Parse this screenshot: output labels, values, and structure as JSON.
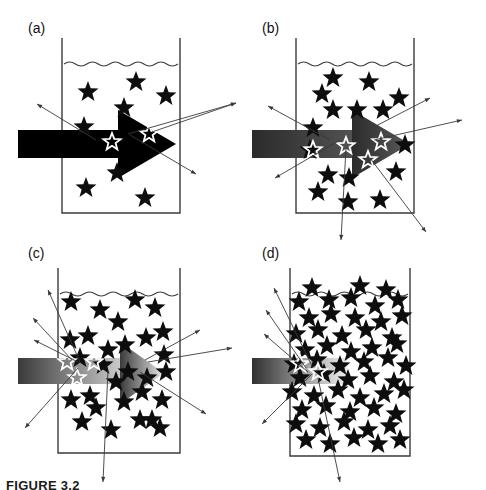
{
  "figure": {
    "caption": "FIGURE 3.2",
    "panels": [
      {
        "id": "a",
        "label": "(a)",
        "label_x": 28,
        "label_y": 33,
        "beaker": {
          "x": 62,
          "y": 38,
          "w": 118,
          "h": 175,
          "rim_extra": 0
        },
        "beam": {
          "style": "solid-arrow",
          "start_color": "#000000",
          "end_color": "#000000",
          "shaft_x": 18,
          "shaft_y": 130,
          "shaft_w": 122,
          "shaft_h": 28,
          "head_x": 118,
          "head_y": 110,
          "head_w": 58,
          "head_h": 68
        },
        "stars_solid": [
          [
            88,
            92
          ],
          [
            136,
            82
          ],
          [
            166,
            96
          ],
          [
            124,
            108
          ],
          [
            117,
            173
          ],
          [
            86,
            188
          ],
          [
            145,
            198
          ],
          [
            84,
            127
          ]
        ],
        "stars_open": [
          [
            112,
            142
          ],
          [
            149,
            134
          ]
        ],
        "star_size": 11,
        "rays": [
          [
            37,
            104,
            96,
            140
          ],
          [
            236,
            103,
            128,
            134
          ],
          [
            196,
            174,
            130,
            135
          ],
          [
            236,
            103,
            152,
            132
          ]
        ]
      },
      {
        "id": "b",
        "label": "(b)",
        "label_x": 262,
        "label_y": 33,
        "beaker": {
          "x": 296,
          "y": 38,
          "w": 118,
          "h": 175,
          "rim_extra": 0
        },
        "beam": {
          "style": "gradient-arrow",
          "start_color": "#2b2b2b",
          "end_color": "#5a5a5a",
          "shaft_x": 252,
          "shaft_y": 130,
          "shaft_w": 122,
          "shaft_h": 28,
          "head_x": 352,
          "head_y": 110,
          "head_w": 58,
          "head_h": 68
        },
        "stars_solid": [
          [
            333,
            78
          ],
          [
            369,
            82
          ],
          [
            322,
            94
          ],
          [
            399,
            98
          ],
          [
            357,
            110
          ],
          [
            333,
            110
          ],
          [
            383,
            110
          ],
          [
            313,
            128
          ],
          [
            328,
            175
          ],
          [
            349,
            178
          ],
          [
            396,
            172
          ],
          [
            318,
            192
          ],
          [
            348,
            202
          ],
          [
            380,
            200
          ],
          [
            405,
            145
          ],
          [
            310,
            150
          ]
        ],
        "stars_open": [
          [
            313,
            150
          ],
          [
            346,
            146
          ],
          [
            381,
            142
          ],
          [
            368,
            160
          ]
        ],
        "star_size": 11,
        "rays": [
          [
            268,
            106,
            330,
            140
          ],
          [
            275,
            178,
            340,
            140
          ],
          [
            430,
            98,
            372,
            128
          ],
          [
            462,
            120,
            374,
            140
          ],
          [
            341,
            240,
            346,
            148
          ],
          [
            426,
            232,
            370,
            158
          ]
        ]
      },
      {
        "id": "c",
        "label": "(c)",
        "label_x": 28,
        "label_y": 258,
        "beaker": {
          "x": 58,
          "y": 268,
          "w": 122,
          "h": 185,
          "rim_extra": 0
        },
        "beam": {
          "style": "gradient-arrow-fading",
          "start_color": "#3a3a3a",
          "end_color": "#e8e8e8",
          "shaft_x": 18,
          "shaft_y": 358,
          "shaft_w": 124,
          "shaft_h": 26,
          "head_x": 120,
          "head_y": 342,
          "head_w": 44,
          "head_h": 62
        },
        "stars_solid": [
          [
            71,
            302
          ],
          [
            100,
            310
          ],
          [
            88,
            336
          ],
          [
            135,
            300
          ],
          [
            70,
            340
          ],
          [
            118,
            322
          ],
          [
            155,
            308
          ],
          [
            125,
            345
          ],
          [
            146,
            338
          ],
          [
            108,
            350
          ],
          [
            164,
            355
          ],
          [
            80,
            358
          ],
          [
            163,
            332
          ],
          [
            128,
            372
          ],
          [
            147,
            378
          ],
          [
            166,
            372
          ],
          [
            116,
            382
          ],
          [
            90,
            396
          ],
          [
            71,
            400
          ],
          [
            96,
            408
          ],
          [
            124,
            402
          ],
          [
            142,
            392
          ],
          [
            162,
            400
          ],
          [
            82,
            422
          ],
          [
            111,
            430
          ],
          [
            140,
            420
          ],
          [
            160,
            428
          ],
          [
            103,
            365
          ],
          [
            152,
            420
          ]
        ],
        "stars_open": [
          [
            67,
            362
          ],
          [
            94,
            362
          ],
          [
            77,
            378
          ]
        ],
        "star_size": 11,
        "rays": [
          [
            48,
            290,
            80,
            362
          ],
          [
            33,
            318,
            72,
            360
          ],
          [
            34,
            340,
            78,
            362
          ],
          [
            25,
            428,
            78,
            368
          ],
          [
            200,
            330,
            145,
            360
          ],
          [
            232,
            348,
            148,
            362
          ],
          [
            206,
            414,
            140,
            372
          ],
          [
            103,
            482,
            108,
            370
          ]
        ]
      },
      {
        "id": "d",
        "label": "(d)",
        "label_x": 262,
        "label_y": 258,
        "beaker": {
          "x": 290,
          "y": 268,
          "w": 120,
          "h": 188,
          "rim_extra": 0
        },
        "beam": {
          "style": "gradient-stub",
          "start_color": "#303030",
          "end_color": "#f2f2f2",
          "shaft_x": 252,
          "shaft_y": 358,
          "shaft_w": 96,
          "shaft_h": 26,
          "head_x": 0,
          "head_y": 0,
          "head_w": 0,
          "head_h": 0
        },
        "stars_solid": [
          [
            299,
            302
          ],
          [
            329,
            300
          ],
          [
            351,
            298
          ],
          [
            375,
            306
          ],
          [
            398,
            300
          ],
          [
            309,
            318
          ],
          [
            331,
            314
          ],
          [
            355,
            318
          ],
          [
            381,
            322
          ],
          [
            402,
            316
          ],
          [
            296,
            334
          ],
          [
            318,
            330
          ],
          [
            342,
            336
          ],
          [
            366,
            330
          ],
          [
            392,
            338
          ],
          [
            305,
            350
          ],
          [
            327,
            346
          ],
          [
            351,
            352
          ],
          [
            372,
            348
          ],
          [
            397,
            344
          ],
          [
            294,
            364
          ],
          [
            317,
            360
          ],
          [
            340,
            366
          ],
          [
            364,
            362
          ],
          [
            388,
            358
          ],
          [
            406,
            366
          ],
          [
            300,
            378
          ],
          [
            324,
            374
          ],
          [
            348,
            380
          ],
          [
            370,
            376
          ],
          [
            394,
            382
          ],
          [
            292,
            392
          ],
          [
            314,
            396
          ],
          [
            338,
            390
          ],
          [
            360,
            398
          ],
          [
            384,
            394
          ],
          [
            404,
            390
          ],
          [
            302,
            410
          ],
          [
            326,
            406
          ],
          [
            350,
            412
          ],
          [
            374,
            408
          ],
          [
            396,
            414
          ],
          [
            296,
            424
          ],
          [
            320,
            428
          ],
          [
            344,
            422
          ],
          [
            368,
            430
          ],
          [
            390,
            426
          ],
          [
            306,
            440
          ],
          [
            330,
            444
          ],
          [
            354,
            438
          ],
          [
            378,
            444
          ],
          [
            400,
            440
          ],
          [
            312,
            288
          ],
          [
            360,
            286
          ],
          [
            386,
            290
          ]
        ],
        "stars_open": [
          [
            300,
            364
          ],
          [
            318,
            372
          ]
        ],
        "star_size": 11,
        "rays": [
          [
            274,
            288,
            312,
            366
          ],
          [
            266,
            310,
            306,
            368
          ],
          [
            264,
            334,
            308,
            372
          ],
          [
            262,
            424,
            312,
            374
          ],
          [
            340,
            482,
            318,
            378
          ]
        ]
      }
    ],
    "wave_amplitude": 4,
    "wave_count": 5
  },
  "colors": {
    "ink": "#111111",
    "line": "#3a3a3a",
    "star_fill": "#0d0d0d",
    "background": "#ffffff"
  }
}
